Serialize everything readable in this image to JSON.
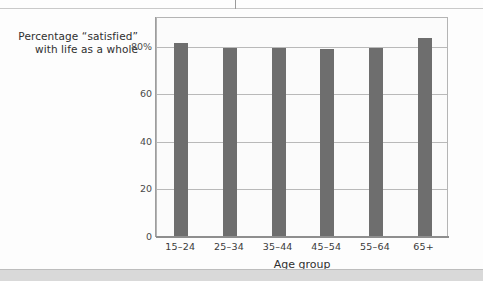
{
  "chart_data": {
    "type": "bar",
    "title": "",
    "categories": [
      "15–24",
      "25–34",
      "35–44",
      "45–54",
      "55–64",
      "65+"
    ],
    "values": [
      81,
      79,
      79,
      78.5,
      79,
      83
    ],
    "series": [
      {
        "name": "Percentage “satisfied” with life as a whole",
        "values": [
          81,
          79,
          79,
          78.5,
          79,
          83
        ]
      }
    ],
    "ylabel_lines": [
      "Percentage “satisfied”",
      "with life as a whole"
    ],
    "xlabel": "Age group",
    "ylim": [
      0,
      92
    ],
    "yticks": [
      0,
      20,
      40,
      60,
      80
    ],
    "ytick_labels": [
      "0",
      "20",
      "40",
      "60",
      "80%"
    ],
    "grid": true,
    "legend": "none",
    "bar_color": "#6e6e6e",
    "plot_background": "#fbfbfb",
    "axis_color": "#8e8e8e",
    "gridline_color": "#b9b9b9"
  }
}
